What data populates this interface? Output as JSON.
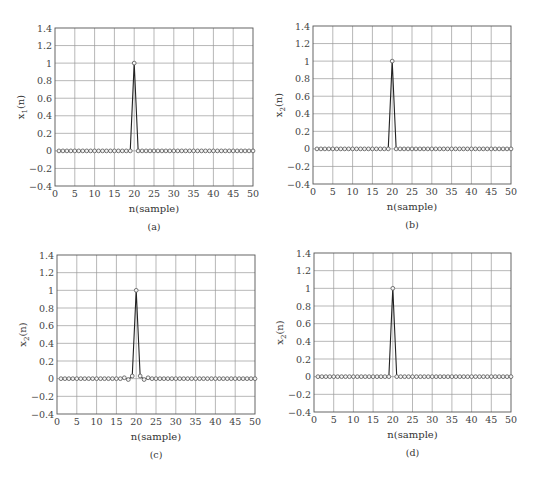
{
  "chart_data": [
    {
      "type": "line",
      "panel_label": "(a)",
      "title": "",
      "xlabel": "n(sample)",
      "ylabel_main": "x",
      "ylabel_sub": "1",
      "ylabel_tail": "(n)",
      "xlim": [
        0,
        50
      ],
      "ylim": [
        -0.4,
        1.4
      ],
      "xticks": [
        0,
        5,
        10,
        15,
        20,
        25,
        30,
        35,
        40,
        45,
        50
      ],
      "yticks": [
        -0.4,
        -0.2,
        0,
        0.2,
        0.4,
        0.6,
        0.8,
        1,
        1.2,
        1.4
      ],
      "ytick_labels": [
        "−0.4",
        "−0.2",
        "0",
        "0.2",
        "0.4",
        "0.6",
        "0.8",
        "1",
        "1.2",
        "1.4"
      ],
      "grid": true,
      "markers": "circle",
      "x": [
        1,
        2,
        3,
        4,
        5,
        6,
        7,
        8,
        9,
        10,
        11,
        12,
        13,
        14,
        15,
        16,
        17,
        18,
        19,
        20,
        21,
        22,
        23,
        24,
        25,
        26,
        27,
        28,
        29,
        30,
        31,
        32,
        33,
        34,
        35,
        36,
        37,
        38,
        39,
        40,
        41,
        42,
        43,
        44,
        45,
        46,
        47,
        48,
        49,
        50
      ],
      "values": [
        0,
        0,
        0,
        0,
        0,
        0,
        0,
        0,
        0,
        0,
        0,
        0,
        0,
        0,
        0,
        0,
        0,
        0,
        0,
        1,
        0,
        0,
        0,
        0,
        0,
        0,
        0,
        0,
        0,
        0,
        0,
        0,
        0,
        0,
        0,
        0,
        0,
        0,
        0,
        0,
        0,
        0,
        0,
        0,
        0,
        0,
        0,
        0,
        0,
        0
      ]
    },
    {
      "type": "line",
      "panel_label": "(b)",
      "title": "",
      "xlabel": "n(sample)",
      "ylabel_main": "x",
      "ylabel_sub": "2",
      "ylabel_tail": "(n)",
      "xlim": [
        0,
        50
      ],
      "ylim": [
        -0.4,
        1.4
      ],
      "xticks": [
        0,
        5,
        10,
        15,
        20,
        25,
        30,
        35,
        40,
        45,
        50
      ],
      "yticks": [
        -0.4,
        -0.2,
        0,
        0.2,
        0.4,
        0.6,
        0.8,
        1,
        1.2,
        1.4
      ],
      "ytick_labels": [
        "−0.4",
        "−0.2",
        "0",
        "0.2",
        "0.4",
        "0.6",
        "0.8",
        "1",
        "1.2",
        "1.4"
      ],
      "grid": true,
      "markers": "circle",
      "x": [
        1,
        2,
        3,
        4,
        5,
        6,
        7,
        8,
        9,
        10,
        11,
        12,
        13,
        14,
        15,
        16,
        17,
        18,
        19,
        20,
        21,
        22,
        23,
        24,
        25,
        26,
        27,
        28,
        29,
        30,
        31,
        32,
        33,
        34,
        35,
        36,
        37,
        38,
        39,
        40,
        41,
        42,
        43,
        44,
        45,
        46,
        47,
        48,
        49,
        50
      ],
      "values": [
        0,
        0,
        0,
        0,
        0,
        0,
        0,
        0,
        0,
        0,
        0,
        0,
        0,
        0,
        0,
        0,
        0,
        0,
        0,
        1,
        0,
        0,
        0,
        0,
        0,
        0,
        0,
        0,
        0,
        0,
        0,
        0,
        0,
        0,
        0,
        0,
        0,
        0,
        0,
        0,
        0,
        0,
        0,
        0,
        0,
        0,
        0,
        0,
        0,
        0
      ]
    },
    {
      "type": "line",
      "panel_label": "(c)",
      "title": "",
      "xlabel": "n(sample)",
      "ylabel_main": "x",
      "ylabel_sub": "2",
      "ylabel_tail": "(n)",
      "xlim": [
        0,
        50
      ],
      "ylim": [
        -0.4,
        1.4
      ],
      "xticks": [
        0,
        5,
        10,
        15,
        20,
        25,
        30,
        35,
        40,
        45,
        50
      ],
      "yticks": [
        -0.4,
        -0.2,
        0,
        0.2,
        0.4,
        0.6,
        0.8,
        1,
        1.2,
        1.4
      ],
      "ytick_labels": [
        "−0.4",
        "−0.2",
        "0",
        "0.2",
        "0.4",
        "0.6",
        "0.8",
        "1",
        "1.2",
        "1.4"
      ],
      "grid": true,
      "markers": "circle",
      "x": [
        1,
        2,
        3,
        4,
        5,
        6,
        7,
        8,
        9,
        10,
        11,
        12,
        13,
        14,
        15,
        16,
        17,
        18,
        19,
        20,
        21,
        22,
        23,
        24,
        25,
        26,
        27,
        28,
        29,
        30,
        31,
        32,
        33,
        34,
        35,
        36,
        37,
        38,
        39,
        40,
        41,
        42,
        43,
        44,
        45,
        46,
        47,
        48,
        49,
        50
      ],
      "values": [
        0,
        0,
        0,
        0,
        0,
        0,
        0,
        0,
        0,
        0,
        0,
        0,
        0,
        0,
        0,
        0,
        0.01,
        -0.01,
        0.03,
        1,
        0.03,
        -0.01,
        0.01,
        0,
        0,
        0,
        0,
        0,
        0,
        0,
        0,
        0,
        0,
        0,
        0,
        0,
        0,
        0,
        0,
        0,
        0,
        0,
        0,
        0,
        0,
        0,
        0,
        0,
        0,
        0
      ]
    },
    {
      "type": "line",
      "panel_label": "(d)",
      "title": "",
      "xlabel": "n(sample)",
      "ylabel_main": "x",
      "ylabel_sub": "2",
      "ylabel_tail": "(n)",
      "xlim": [
        0,
        50
      ],
      "ylim": [
        -0.4,
        1.4
      ],
      "xticks": [
        0,
        5,
        10,
        15,
        20,
        25,
        30,
        35,
        40,
        45,
        50
      ],
      "yticks": [
        -0.4,
        -0.2,
        0,
        0.2,
        0.4,
        0.6,
        0.8,
        1,
        1.2,
        1.4
      ],
      "ytick_labels": [
        "−0.4",
        "−0.2",
        "0",
        "0.2",
        "0.4",
        "0.6",
        "0.8",
        "1",
        "1.2",
        "1.4"
      ],
      "grid": true,
      "markers": "circle",
      "x": [
        1,
        2,
        3,
        4,
        5,
        6,
        7,
        8,
        9,
        10,
        11,
        12,
        13,
        14,
        15,
        16,
        17,
        18,
        19,
        20,
        21,
        22,
        23,
        24,
        25,
        26,
        27,
        28,
        29,
        30,
        31,
        32,
        33,
        34,
        35,
        36,
        37,
        38,
        39,
        40,
        41,
        42,
        43,
        44,
        45,
        46,
        47,
        48,
        49,
        50
      ],
      "values": [
        0,
        0,
        0,
        0,
        0,
        0,
        0,
        0,
        0,
        0,
        0,
        0,
        0,
        0,
        0,
        0,
        0,
        0,
        0,
        1,
        0,
        0,
        0,
        0,
        0,
        0,
        0,
        0,
        0,
        0,
        0,
        0,
        0,
        0,
        0,
        0,
        0,
        0,
        0,
        0,
        0,
        0,
        0,
        0,
        0,
        0,
        0,
        0,
        0,
        0
      ]
    }
  ]
}
